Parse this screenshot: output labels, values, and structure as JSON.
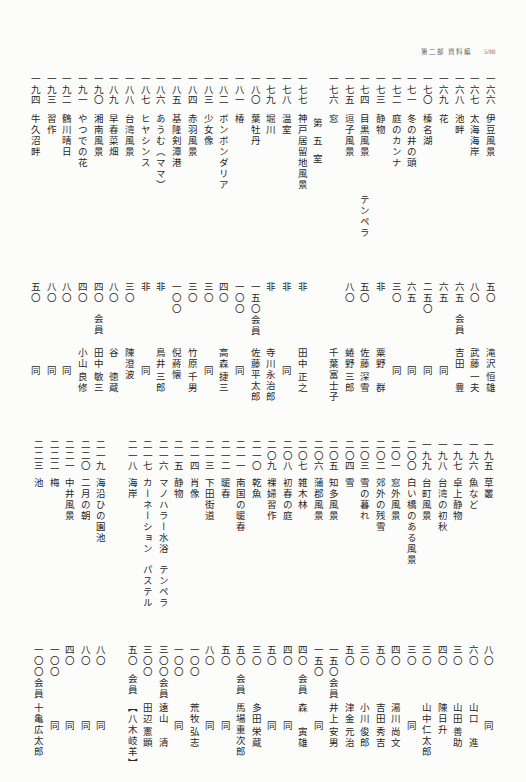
{
  "header": {
    "section": "第二部 資料編",
    "page": "598"
  },
  "upper": {
    "entries": [
      {
        "no": "一六六",
        "title": "伊豆風景",
        "price": "五〇",
        "artist": {
          "family": "滝沢",
          "given": "恒雄"
        }
      },
      {
        "no": "一六七",
        "title": "太海海岸",
        "price": "八〇",
        "artist": {
          "family": "武藤",
          "given": "一夫"
        }
      },
      {
        "no": "一六八",
        "title": "池畔",
        "price": "六五",
        "member": "会員",
        "artist": {
          "family": "吉田",
          "given": "豊"
        }
      },
      {
        "no": "一六九",
        "title": "花",
        "price": "六五",
        "artist": {
          "family": "同"
        }
      },
      {
        "no": "一七〇",
        "title": "榛名湖",
        "price": "二五〇",
        "artist": {
          "family": "同"
        }
      },
      {
        "no": "一七一",
        "title": "冬の井の頭",
        "price": "六五",
        "artist": {
          "family": "同"
        }
      },
      {
        "no": "一七二",
        "title": "庭のカンナ",
        "price": "三〇",
        "artist": {
          "family": "同"
        }
      },
      {
        "no": "一七三",
        "title": "静物",
        "price": "非",
        "artist": {
          "family": "粟野",
          "given": "群"
        }
      },
      {
        "no": "一七四",
        "title": "目黒風景",
        "medium": "テンペラ",
        "price": "五〇",
        "artist": {
          "family": "佐藤",
          "given": "深雪"
        }
      },
      {
        "no": "一七五",
        "title": "逗子風景",
        "price": "八〇",
        "artist": {
          "family": "蜷野",
          "given": "三郎"
        }
      },
      {
        "no": "一七六",
        "title": "窓",
        "artist": {
          "family": "千葉富士子"
        }
      },
      {
        "section": "第五室"
      },
      {
        "no": "一七七",
        "title": "神戸居留地風景",
        "price": "非",
        "artist": {
          "family": "田中",
          "given": "正之"
        }
      },
      {
        "no": "一七八",
        "title": "温室",
        "price": "非",
        "artist": {
          "family": "同"
        }
      },
      {
        "no": "一七九",
        "title": "堀川",
        "price": "非",
        "artist": {
          "family": "寺川永治郎"
        }
      },
      {
        "no": "一八〇",
        "title": "葉牡丹",
        "price": "一五〇",
        "member": "会員",
        "artist": {
          "family": "佐藤平太郎"
        }
      },
      {
        "no": "一八一",
        "title": "椿",
        "price": "一〇〇",
        "artist": {
          "family": "同"
        }
      },
      {
        "no": "一八二",
        "title": "ボンボンダリア",
        "price": "四〇",
        "artist": {
          "family": "高森",
          "given": "捷三"
        }
      },
      {
        "no": "一八三",
        "title": "少女像",
        "price": "三〇",
        "artist": {
          "family": "同"
        }
      },
      {
        "no": "一八四",
        "title": "赤羽風景",
        "price": "三〇",
        "artist": {
          "family": "竹原",
          "given": "千男"
        }
      },
      {
        "no": "一八五",
        "title": "基隆剣潭港",
        "price": "一〇〇",
        "artist": {
          "family": "倪蔣懐"
        }
      },
      {
        "no": "一八六",
        "title": "あうむ（ママ）",
        "price": "非",
        "artist": {
          "family": "鳥井",
          "given": "三郎"
        }
      },
      {
        "no": "一八七",
        "title": "ヒヤシンス",
        "price": "非",
        "artist": {
          "family": "同"
        }
      },
      {
        "no": "一八八",
        "title": "台湾風景",
        "price": "三〇",
        "artist": {
          "family": "陳澄波"
        }
      },
      {
        "no": "一八九",
        "title": "早春菜畑",
        "price": "八〇",
        "artist": {
          "family": "谷",
          "given": "徳蔵"
        }
      },
      {
        "no": "一九〇",
        "title": "湘南風景",
        "price": "四〇",
        "member": "会員",
        "artist": {
          "family": "田中",
          "given": "敏三"
        }
      },
      {
        "no": "一九一",
        "title": "やつでの花",
        "price": "四〇",
        "artist": {
          "family": "小山",
          "given": "良修"
        }
      },
      {
        "no": "一九二",
        "title": "鶴川晴日",
        "price": "八〇",
        "artist": {
          "family": "同"
        }
      },
      {
        "no": "一九三",
        "title": "習作",
        "price": "八〇",
        "artist": {
          "family": "同"
        }
      },
      {
        "no": "一九四",
        "title": "牛久沼畔",
        "price": "五〇",
        "artist": {
          "family": "同"
        }
      }
    ]
  },
  "lower": {
    "entries": [
      {
        "no": "一九五",
        "title": "草叢",
        "price": "八〇",
        "artist": {
          "family": "同"
        }
      },
      {
        "no": "一九六",
        "title": "魚など",
        "price": "六〇",
        "artist": {
          "family": "山口",
          "given": "進"
        }
      },
      {
        "no": "一九七",
        "title": "卓上静物",
        "price": "三〇",
        "artist": {
          "family": "山田",
          "given": "善助"
        }
      },
      {
        "no": "一九八",
        "title": "台湾の初秋",
        "price": "四〇",
        "artist": {
          "family": "陳日升"
        }
      },
      {
        "no": "一九九",
        "title": "台町風景",
        "price": "三〇",
        "artist": {
          "family": "山中仁太郎"
        }
      },
      {
        "no": "二〇〇",
        "title": "白い橋のある風景",
        "price": "三〇",
        "artist": {
          "family": "同"
        }
      },
      {
        "no": "二〇一",
        "title": "窓外風景",
        "price": "四〇",
        "artist": {
          "family": "湯川",
          "given": "尚文"
        }
      },
      {
        "no": "二〇二",
        "title": "郊外の残雪",
        "price": "五〇",
        "artist": {
          "family": "吉田",
          "given": "秀吉"
        }
      },
      {
        "no": "二〇三",
        "title": "雪の暮れ",
        "price": "三〇",
        "artist": {
          "family": "小川",
          "given": "俊郎"
        }
      },
      {
        "no": "二〇四",
        "title": "雪",
        "price": "五〇",
        "artist": {
          "family": "津金",
          "given": "元治"
        }
      },
      {
        "no": "二〇五",
        "title": "知多風景",
        "price": "一五〇",
        "member": "会員",
        "artist": {
          "family": "井上",
          "given": "安男"
        }
      },
      {
        "no": "二〇六",
        "title": "蒲郡風景",
        "price": "一五〇",
        "artist": {
          "family": "同"
        }
      },
      {
        "no": "二〇七",
        "title": "雑木林",
        "price": "四〇",
        "member": "会員",
        "artist": {
          "family": "森",
          "given": "寅雄"
        }
      },
      {
        "no": "二〇八",
        "title": "初春の庭",
        "price": "四〇",
        "artist": {
          "family": "同"
        }
      },
      {
        "no": "二〇九",
        "title": "裸婦習作",
        "price": "五〇",
        "artist": {
          "family": "同"
        }
      },
      {
        "no": "二一〇",
        "title": "乾魚",
        "price": "三〇",
        "artist": {
          "family": "多田",
          "given": "栄蔵"
        }
      },
      {
        "no": "二一一",
        "title": "南国の暖春",
        "price": "五〇",
        "member": "会員",
        "artist": {
          "family": "馬場重次郎"
        }
      },
      {
        "no": "二一二",
        "title": "暖春",
        "price": "五〇",
        "artist": {
          "family": "同"
        }
      },
      {
        "no": "二一三",
        "title": "下田街道",
        "price": "八〇",
        "artist": {
          "family": "同"
        }
      },
      {
        "no": "二一四",
        "title": "肖像",
        "price": "一〇〇",
        "artist": {
          "family": "荒牧",
          "given": "弘志"
        }
      },
      {
        "no": "二一五",
        "title": "静物",
        "price": "一〇〇",
        "artist": {
          "family": "同"
        }
      },
      {
        "no": "二一六",
        "title": "マノハラー水浴",
        "medium": "テンペラ",
        "price": "三〇〇",
        "member": "会員",
        "artist": {
          "family": "遠山",
          "given": "清"
        }
      },
      {
        "no": "二一七",
        "title": "カーネーション",
        "medium": "パステル",
        "price": "三〇〇",
        "artist": {
          "family": "田辺",
          "given": "憲顕"
        }
      },
      {
        "no": "二一八",
        "title": "海岸",
        "price": "五〇",
        "member": "会員",
        "artist": {
          "family": "【八木",
          "given": "岐羊】"
        }
      },
      {
        "no": "二一九",
        "title": "海沿ひの園池",
        "price": "八〇",
        "artist": {
          "family": "同"
        }
      },
      {
        "no": "二二〇",
        "title": "二月の朝",
        "price": "八〇",
        "artist": {
          "family": "同"
        }
      },
      {
        "no": "二二一",
        "title": "中井風景",
        "price": "四〇",
        "artist": {
          "family": "同"
        }
      },
      {
        "no": "二二二",
        "title": "梅",
        "price": "一〇〇",
        "artist": {
          "family": "同"
        }
      },
      {
        "no": "二二三",
        "title": "池",
        "price": "一〇〇",
        "member": "会員",
        "artist": {
          "family": "十亀広太郎"
        }
      }
    ]
  }
}
